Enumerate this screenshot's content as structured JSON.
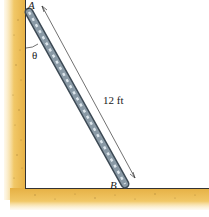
{
  "figure": {
    "labels": {
      "point_a": "A",
      "point_b": "B",
      "angle": "θ",
      "length": "12 ft"
    },
    "colors": {
      "ground": "#e8b84a",
      "ground_edge": "#f6dd9a",
      "speckle": "#8a6a2a",
      "ladder_rail": "#3d4a55",
      "ladder_fill": "#8a9aa6",
      "rung": "#dde6ec",
      "line": "#333333"
    }
  }
}
